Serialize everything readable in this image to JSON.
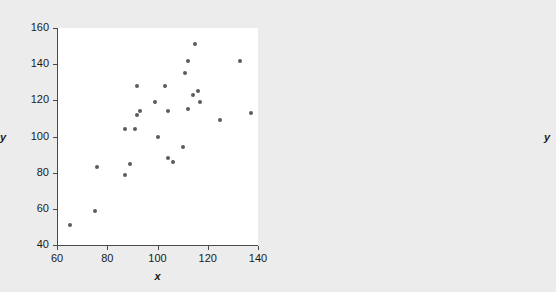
{
  "figure": {
    "background_color": "#ececec",
    "plot_background_color": "#ffffff",
    "axis_color": "#4a4a4a",
    "marker_color": "#5b5b5b",
    "panel_count": 2
  },
  "chart_data": [
    {
      "type": "scatter",
      "panel": "left",
      "title": "",
      "xlabel": "x",
      "ylabel": "y",
      "xlim": [
        60,
        140
      ],
      "ylim": [
        40,
        160
      ],
      "xticks": [
        60,
        80,
        100,
        120,
        140
      ],
      "yticks": [
        40,
        60,
        80,
        100,
        120,
        140,
        160
      ],
      "xticklabels": [
        "60",
        "80",
        "100",
        "120",
        "140"
      ],
      "yticklabels": [
        "40",
        "60",
        "80",
        "100",
        "120",
        "140",
        "160"
      ],
      "grid": false,
      "legend": null,
      "x": [
        65,
        75,
        76,
        87,
        87,
        89,
        91,
        92,
        92,
        93,
        99,
        100,
        103,
        104,
        104,
        106,
        110,
        111,
        112,
        112,
        114,
        115,
        116,
        117,
        125,
        133,
        137
      ],
      "y": [
        51,
        59,
        83,
        79,
        104,
        85,
        104,
        112,
        128,
        114,
        119,
        100,
        128,
        88,
        114,
        86,
        94,
        135,
        115,
        142,
        123,
        151,
        125,
        119,
        109,
        142,
        113
      ]
    },
    {
      "type": "scatter",
      "panel": "right",
      "title": "",
      "xlabel": "x",
      "ylabel": "y",
      "xlim": [
        0,
        250
      ],
      "ylim": [
        0,
        250
      ],
      "xticks": [
        0,
        50,
        100,
        150,
        200,
        250
      ],
      "yticks": [
        0,
        50,
        100,
        150,
        200,
        250
      ],
      "xticklabels": [
        "0",
        "50",
        "100",
        "150",
        "200",
        "250"
      ],
      "yticklabels": [
        "0",
        "50",
        "100",
        "150",
        "200",
        "250"
      ],
      "grid": false,
      "legend": null,
      "x": [
        65,
        75,
        76,
        87,
        87,
        89,
        91,
        92,
        92,
        93,
        99,
        100,
        103,
        104,
        104,
        106,
        110,
        111,
        112,
        112,
        114,
        115,
        116,
        117,
        125,
        133,
        137
      ],
      "y": [
        51,
        59,
        83,
        79,
        104,
        85,
        104,
        112,
        128,
        114,
        119,
        100,
        128,
        88,
        114,
        86,
        94,
        135,
        115,
        142,
        123,
        151,
        125,
        119,
        109,
        142,
        113
      ]
    }
  ]
}
